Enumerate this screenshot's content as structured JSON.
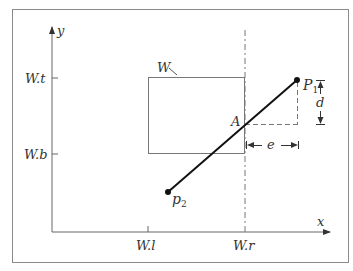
{
  "diagram": {
    "type": "line-clipping-window",
    "axes": {
      "x_label": "x",
      "y_label": "y"
    },
    "ticks": {
      "y": [
        {
          "label": "W.t"
        },
        {
          "label": "W.b"
        }
      ],
      "x": [
        {
          "label": "W.l"
        },
        {
          "label": "W.r"
        }
      ]
    },
    "window": {
      "label": "W"
    },
    "points": {
      "p1": {
        "label": "P",
        "sub": "1"
      },
      "p2": {
        "label": "p",
        "sub": "2"
      },
      "a": {
        "label": "A"
      }
    },
    "dimensions": {
      "d": {
        "label": "d"
      },
      "e": {
        "label": "e"
      }
    }
  },
  "colors": {
    "frame": "#777777",
    "axis": "#666666",
    "segment": "#111111",
    "dashed": "#777777",
    "text": "#333333"
  }
}
